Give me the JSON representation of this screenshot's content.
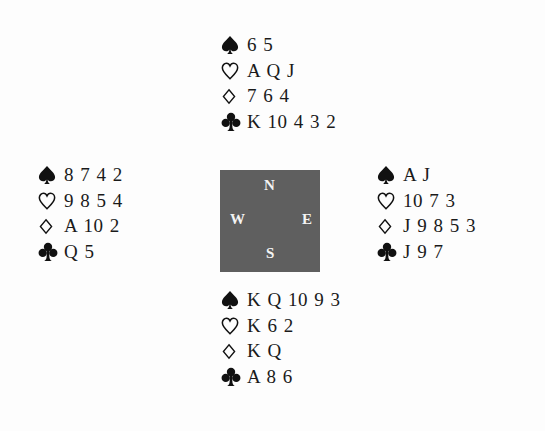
{
  "diagram": {
    "type": "bridge-deal",
    "compass": {
      "north_label": "N",
      "south_label": "S",
      "west_label": "W",
      "east_label": "E",
      "background_color": "#5f5f5f",
      "text_color": "#f4f4f4"
    },
    "suits": {
      "spades": "spade-icon",
      "hearts": "heart-icon",
      "diamonds": "diamond-icon",
      "clubs": "club-icon"
    },
    "hands": {
      "north": {
        "spades": "6 5",
        "hearts": "A Q J",
        "diamonds": "7 6 4",
        "clubs": "K 10 4 3 2"
      },
      "west": {
        "spades": "8 7 4 2",
        "hearts": "9 8 5 4",
        "diamonds": "A 10 2",
        "clubs": "Q 5"
      },
      "east": {
        "spades": "A J",
        "hearts": "10 7 3",
        "diamonds": "J 9 8 5 3",
        "clubs": "J 9 7"
      },
      "south": {
        "spades": "K Q 10 9 3",
        "hearts": "K 6 2",
        "diamonds": "K Q",
        "clubs": "A 8 6"
      }
    }
  }
}
